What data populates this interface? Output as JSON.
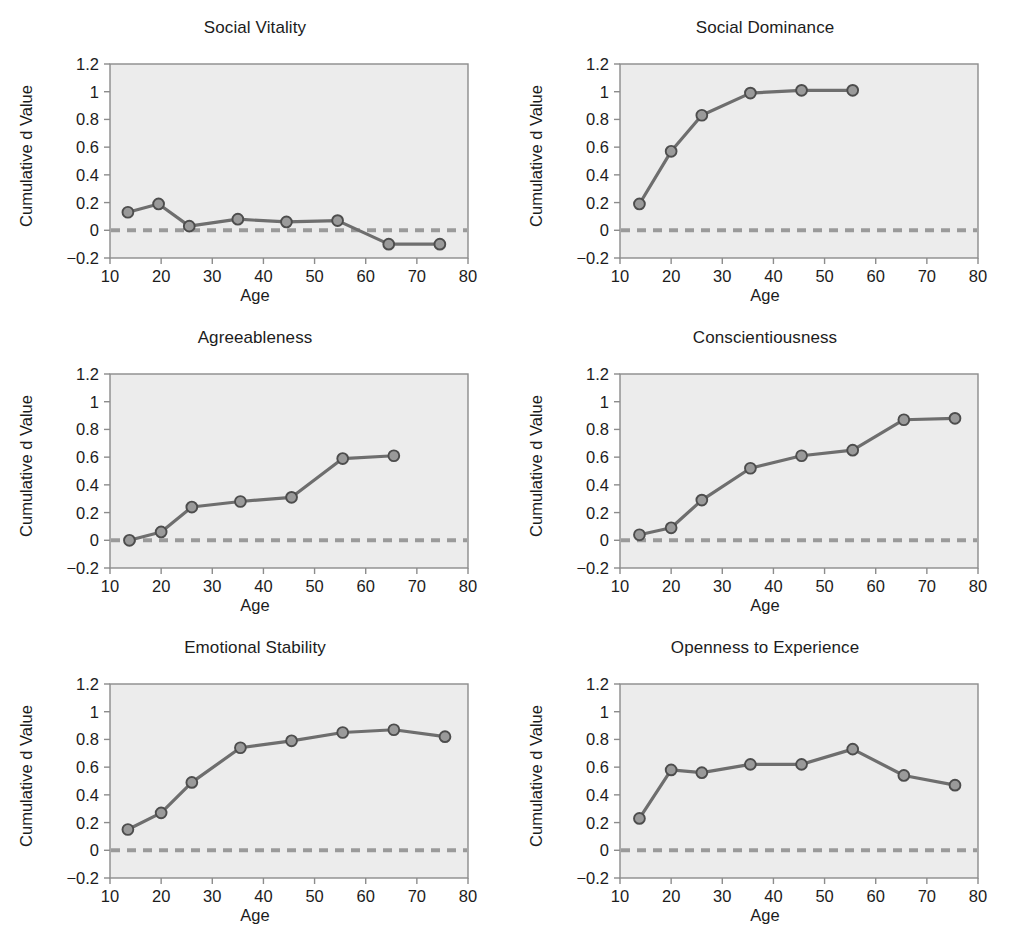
{
  "figure": {
    "background_color": "#ffffff",
    "panel_bg_color": "#ececec",
    "axis_color": "#8c8c8c",
    "line_color": "#6e6e6e",
    "marker_fill": "#9a9a9a",
    "marker_edge": "#4d4d4d",
    "zero_line_color": "#9a9a9a",
    "text_color": "#1c1c1c"
  },
  "axes": {
    "xlabel": "Age",
    "ylabel": "Cumulative d Value",
    "xlim": [
      10,
      80
    ],
    "ylim": [
      -0.2,
      1.2
    ],
    "xticks": [
      10,
      20,
      30,
      40,
      50,
      60,
      70,
      80
    ],
    "xticklabels": [
      "10",
      "20",
      "30",
      "40",
      "50",
      "60",
      "70",
      "80"
    ],
    "yticks": [
      -0.2,
      0,
      0.2,
      0.4,
      0.6,
      0.8,
      1,
      1.2
    ],
    "yticklabels": [
      "−0.2",
      "0",
      "0.2",
      "0.4",
      "0.6",
      "0.8",
      "1",
      "1.2"
    ],
    "grid": false,
    "reference_line": 0
  },
  "chart_data": [
    {
      "type": "line",
      "title": "Social Vitality",
      "xlabel": "Age",
      "ylabel": "Cumulative d Value",
      "xlim": [
        10,
        80
      ],
      "ylim": [
        -0.2,
        1.2
      ],
      "x": [
        13.5,
        19.5,
        25.5,
        35.0,
        44.5,
        54.5,
        64.5,
        74.5
      ],
      "values": [
        0.13,
        0.19,
        0.03,
        0.08,
        0.06,
        0.07,
        -0.1,
        -0.1
      ]
    },
    {
      "type": "line",
      "title": "Social Dominance",
      "xlabel": "Age",
      "ylabel": "Cumulative d Value",
      "xlim": [
        10,
        80
      ],
      "ylim": [
        -0.2,
        1.2
      ],
      "x": [
        13.8,
        20.0,
        26.0,
        35.5,
        45.5,
        55.5
      ],
      "values": [
        0.19,
        0.57,
        0.83,
        0.99,
        1.01,
        1.01
      ]
    },
    {
      "type": "line",
      "title": "Agreeableness",
      "xlabel": "Age",
      "ylabel": "Cumulative d Value",
      "xlim": [
        10,
        80
      ],
      "ylim": [
        -0.2,
        1.2
      ],
      "x": [
        13.8,
        20.0,
        26.0,
        35.5,
        45.5,
        55.5,
        65.5
      ],
      "values": [
        0.0,
        0.06,
        0.24,
        0.28,
        0.31,
        0.59,
        0.61
      ]
    },
    {
      "type": "line",
      "title": "Conscientiousness",
      "xlabel": "Age",
      "ylabel": "Cumulative d Value",
      "xlim": [
        10,
        80
      ],
      "ylim": [
        -0.2,
        1.2
      ],
      "x": [
        13.8,
        20.0,
        26.0,
        35.5,
        45.5,
        55.5,
        65.5,
        75.5
      ],
      "values": [
        0.04,
        0.09,
        0.29,
        0.52,
        0.61,
        0.65,
        0.87,
        0.88
      ]
    },
    {
      "type": "line",
      "title": "Emotional Stability",
      "xlabel": "Age",
      "ylabel": "Cumulative d Value",
      "xlim": [
        10,
        80
      ],
      "ylim": [
        -0.2,
        1.2
      ],
      "x": [
        13.5,
        20.0,
        26.0,
        35.5,
        45.5,
        55.5,
        65.5,
        75.5
      ],
      "values": [
        0.15,
        0.27,
        0.49,
        0.74,
        0.79,
        0.85,
        0.87,
        0.82
      ]
    },
    {
      "type": "line",
      "title": "Openness to Experience",
      "xlabel": "Age",
      "ylabel": "Cumulative d Value",
      "xlim": [
        10,
        80
      ],
      "ylim": [
        -0.2,
        1.2
      ],
      "x": [
        13.8,
        20.0,
        26.0,
        35.5,
        45.5,
        55.5,
        65.5,
        75.5
      ],
      "values": [
        0.23,
        0.58,
        0.56,
        0.62,
        0.62,
        0.73,
        0.54,
        0.47
      ]
    }
  ]
}
